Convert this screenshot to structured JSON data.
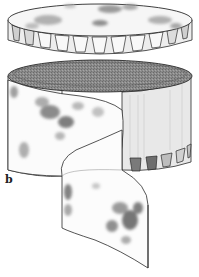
{
  "figure": {
    "panel_label": "b",
    "colors": {
      "line": "#2a2a2a",
      "shade_dark": "#6e6e6e",
      "shade_mid": "#9a9a9a",
      "shade_light": "#cfcfcf",
      "inner_dark": "#858585",
      "background": "#ffffff"
    }
  }
}
